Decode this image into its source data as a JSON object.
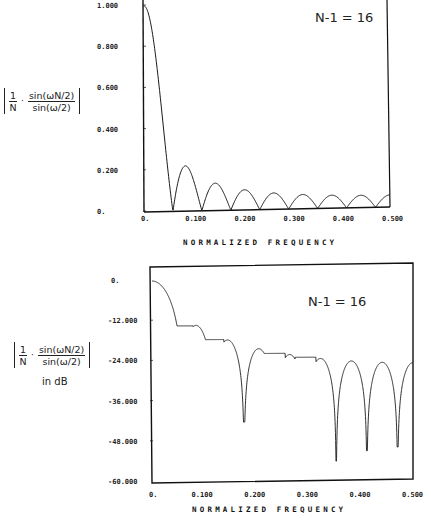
{
  "chart_data": [
    {
      "type": "line",
      "title": "",
      "annotation": "N-1 = 16",
      "xlabel": "NORMALIZED FREQUENCY",
      "ylabel": "|1/N · sin(ωN/2)/sin(ω/2)|",
      "xlim": [
        0,
        0.5
      ],
      "ylim": [
        0,
        1.0
      ],
      "x_ticks": [
        "0.",
        "0.100",
        "0.200",
        "0.300",
        "0.400",
        "0.500"
      ],
      "y_ticks": [
        "1.000",
        "0.800",
        "0.600",
        "0.400",
        "0.200",
        "0."
      ],
      "grid": false,
      "series": [
        {
          "name": "linear magnitude",
          "N": 17,
          "x": [
            0.0,
            0.0294,
            0.0588,
            0.0882,
            0.1176,
            0.147,
            0.1765,
            0.2059,
            0.2353,
            0.2647,
            0.2941,
            0.3235,
            0.3529,
            0.3824,
            0.4118,
            0.4412,
            0.4706,
            0.5
          ],
          "values": [
            1.0,
            0.637,
            0.0,
            0.217,
            0.0,
            0.135,
            0.0,
            0.101,
            0.0,
            0.083,
            0.0,
            0.073,
            0.0,
            0.065,
            0.0,
            0.061,
            0.0,
            0.059
          ]
        }
      ]
    },
    {
      "type": "line",
      "title": "",
      "annotation": "N-1 = 16",
      "xlabel": "NORMALIZED FREQUENCY",
      "ylabel": "|1/N · sin(ωN/2)/sin(ω/2)| in dB",
      "xlim": [
        0,
        0.5
      ],
      "ylim": [
        -60,
        0
      ],
      "x_ticks": [
        "0.",
        "0.100",
        "0.200",
        "0.300",
        "0.400",
        "0.500"
      ],
      "y_ticks": [
        "0.",
        "-12.000",
        "-24.000",
        "-36.000",
        "-48.000",
        "-60.000"
      ],
      "grid": false,
      "series": [
        {
          "name": "magnitude in dB",
          "N": 17,
          "x": [
            0.0,
            0.0588,
            0.0882,
            0.1176,
            0.147,
            0.1765,
            0.2059,
            0.2353,
            0.2647,
            0.2941,
            0.3235,
            0.3529,
            0.3824,
            0.4118,
            0.4412,
            0.4706,
            0.5
          ],
          "values": [
            0.0,
            -33,
            -13.3,
            -57,
            -17.4,
            -42,
            -19.9,
            -55,
            -21.6,
            -47,
            -22.8,
            -54,
            -23.7,
            -51,
            -24.3,
            -50,
            -24.6
          ]
        }
      ]
    }
  ],
  "top": {
    "annotation": "N-1 = 16",
    "x_axis_title": "NORMALIZED FREQUENCY",
    "x_ticks": [
      "0.",
      "0.100",
      "0.200",
      "0.300",
      "0.400",
      "0.500"
    ],
    "y_ticks": [
      "1.000",
      "0.800",
      "0.600",
      "0.400",
      "0.200",
      "0."
    ],
    "formula": {
      "lhs_num": "1",
      "lhs_den": "N",
      "dot": "·",
      "rhs_num": "sin(ωN/2)",
      "rhs_den": "sin(ω/2)"
    }
  },
  "bottom": {
    "annotation": "N-1 = 16",
    "x_axis_title": "NORMALIZED FREQUENCY",
    "x_ticks": [
      "0.",
      "0.100",
      "0.200",
      "0.300",
      "0.400",
      "0.500"
    ],
    "y_ticks": [
      "0.",
      "-12.000",
      "-24.000",
      "-36.000",
      "-48.000",
      "-60.000"
    ],
    "formula": {
      "lhs_num": "1",
      "lhs_den": "N",
      "dot": "·",
      "rhs_num": "sin(ωN/2)",
      "rhs_den": "sin(ω/2)",
      "suffix": "in dB"
    }
  },
  "style": {
    "line_color": "#1a1a1a",
    "background": "#ffffff"
  }
}
